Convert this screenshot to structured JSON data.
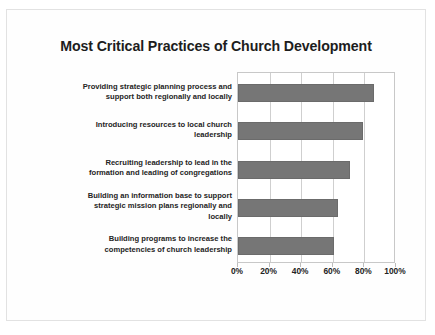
{
  "chart_data": {
    "type": "bar",
    "orientation": "horizontal",
    "title": "Most Critical Practices of Church Development",
    "xlabel": "",
    "ylabel": "",
    "xlim": [
      0,
      100
    ],
    "xticks": [
      0,
      20,
      40,
      60,
      80,
      100
    ],
    "xtick_labels": [
      "0%",
      "20%",
      "40%",
      "60%",
      "80%",
      "100%"
    ],
    "grid": true,
    "grid_axis": "x",
    "legend": false,
    "legend_position": "none",
    "bar_color": "#767676",
    "categories": [
      "Providing strategic planning process and support both regionally and locally",
      "Introducing resources to local church leadership",
      "Recruiting leadership to lead in the formation and leading of congregations",
      "Building an information base to support strategic mission plans regionally and locally",
      "Building programs to increase the competencies of church leadership"
    ],
    "values": [
      86,
      79,
      71,
      63,
      61
    ],
    "series": [
      {
        "name": "Percent",
        "values": [
          86,
          79,
          71,
          63,
          61
        ]
      }
    ]
  },
  "category_lines": [
    [
      "Providing strategic planning process and",
      "support both regionally and locally"
    ],
    [
      "Introducing resources to local church",
      "leadership"
    ],
    [
      "Recruiting leadership to lead in the",
      "formation and leading of congregations"
    ],
    [
      "Building an information base to support",
      "strategic mission plans regionally and",
      "locally"
    ],
    [
      "Building programs to increase the",
      "competencies of church leadership"
    ]
  ]
}
